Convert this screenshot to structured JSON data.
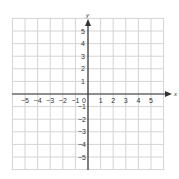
{
  "diagram": {
    "type": "coordinate-plane",
    "x_axis": {
      "label": "x",
      "min": -5,
      "max": 5,
      "ticks": [
        "−5",
        "−4",
        "−3",
        "−2",
        "−1",
        "0",
        "1",
        "2",
        "3",
        "4",
        "5"
      ]
    },
    "y_axis": {
      "label": "y",
      "min": -5,
      "max": 5,
      "ticks_pos": [
        "1",
        "2",
        "3",
        "4",
        "5"
      ],
      "ticks_neg": [
        "−1",
        "−2",
        "−3",
        "−4",
        "−5"
      ]
    },
    "origin_label": "0",
    "colors": {
      "grid": "#d4d4d4",
      "axis": "#333333",
      "text": "#333333"
    }
  }
}
